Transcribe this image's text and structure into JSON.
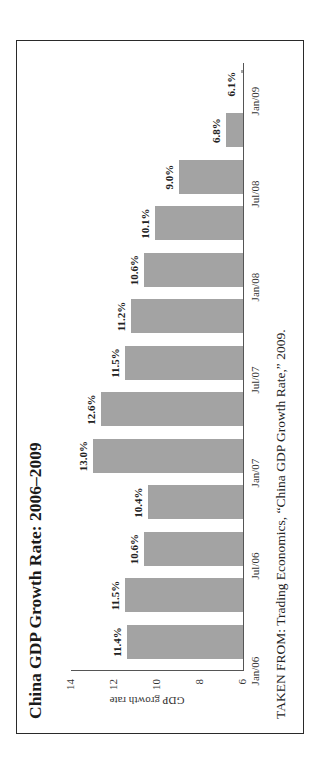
{
  "chart_data": {
    "type": "bar",
    "title": "China GDP Growth Rate: 2006–2009",
    "xlabel": "",
    "ylabel": "GDP growth rate",
    "ylim": [
      6,
      14
    ],
    "yticks": [
      6,
      8,
      10,
      12,
      14
    ],
    "categories": [
      "Q1 2006",
      "Q2 2006",
      "Q3 2006",
      "Q4 2006",
      "Q1 2007",
      "Q2 2007",
      "Q3 2007",
      "Q4 2007",
      "Q1 2008",
      "Q2 2008",
      "Q3 2008",
      "Q4 2008",
      "Q1 2009"
    ],
    "values": [
      11.4,
      11.5,
      10.6,
      10.4,
      13.0,
      12.6,
      11.5,
      11.2,
      10.6,
      10.1,
      9.0,
      6.8,
      6.1
    ],
    "value_labels": [
      "11.4%",
      "11.5%",
      "10.6%",
      "10.4%",
      "13.0%",
      "12.6%",
      "11.5%",
      "11.2%",
      "10.6%",
      "10.1%",
      "9.0%",
      "6.8%",
      "6.1%"
    ],
    "x_tick_labels": [
      "Jan/06",
      "Jul/06",
      "Jan/07",
      "Jul/07",
      "Jan/08",
      "Jul/08",
      "Jan/09"
    ],
    "grid": false,
    "legend": null,
    "bar_color": "#a3a3a3",
    "orientation_note": "figure rotated 90° counter-clockwise on page",
    "source": "TAKEN FROM: Trading Economics, “China GDP Growth Rate,” 2009."
  },
  "text": {
    "title": "China GDP Growth Rate: 2006–2009",
    "ylabel": "GDP growth rate",
    "source": "TAKEN FROM: Trading Economics, “China GDP Growth Rate,” 2009."
  }
}
